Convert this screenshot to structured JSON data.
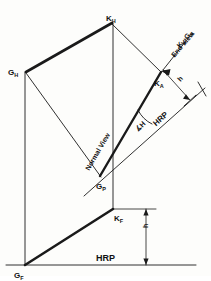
{
  "drawing": {
    "title": "Descriptive geometry line views",
    "stroke_color": "#1a1a1a",
    "paper_color": "#fdfdfb"
  },
  "labels": {
    "k_h": {
      "base": "K",
      "sub": "H"
    },
    "g_h": {
      "base": "G",
      "sub": "H"
    },
    "g_p": {
      "base": "G",
      "sub": "P"
    },
    "g_f": {
      "base": "G",
      "sub": "F"
    },
    "k_f": {
      "base": "K",
      "sub": "F"
    },
    "k_a": {
      "base": "K",
      "sub": "A"
    },
    "end_view_line": {
      "base": "K",
      "sub": "A",
      "base2": "-G",
      "sub2": "A"
    },
    "end_view": "End View",
    "normal_view": "Normal View",
    "angle_h": "∡H",
    "hrp_diagonal": "HRP",
    "hrp_bottom": "HRP",
    "height_h": "h",
    "height_h2": "h"
  },
  "geometry": {
    "points": {
      "K_H": [
        112,
        23
      ],
      "G_H": [
        26,
        72
      ],
      "G_P": [
        100,
        176
      ],
      "K_A": [
        160,
        72
      ],
      "K_F": [
        113,
        209
      ],
      "G_F": [
        25,
        265
      ]
    },
    "hrp_bottom_y": 265,
    "hrp_diagonal_from": [
      118,
      140
    ],
    "hrp_diagonal_to": [
      205,
      88
    ]
  }
}
